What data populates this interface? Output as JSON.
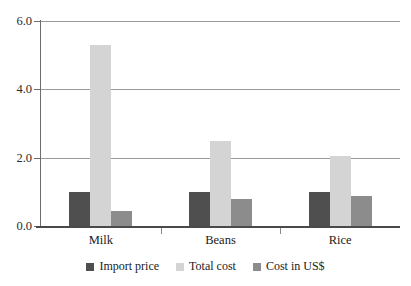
{
  "chart_data": {
    "type": "bar",
    "title": "",
    "subtitle": "",
    "xlabel": "",
    "ylabel": "",
    "categories": [
      "Milk",
      "Beans",
      "Rice"
    ],
    "series": [
      {
        "name": "Import price",
        "color": "#4f4f4f",
        "values": [
          1.0,
          1.0,
          1.0
        ]
      },
      {
        "name": "Total cost",
        "color": "#d4d4d4",
        "values": [
          5.3,
          2.5,
          2.05
        ]
      },
      {
        "name": "Cost in US$",
        "color": "#8c8c8c",
        "values": [
          0.44,
          0.78,
          0.87
        ]
      }
    ],
    "ylim": [
      0.0,
      6.0
    ],
    "ytick_values": [
      0.0,
      2.0,
      4.0,
      6.0
    ],
    "ytick_labels": [
      "0.0",
      "2.0",
      "4.0",
      "6.0"
    ],
    "grid": true,
    "gridlines_at": [
      2.0,
      4.0,
      6.0
    ],
    "legend_position": "bottom-center",
    "orientation": "vertical",
    "grouping": "clustered"
  },
  "axes": {
    "y_axis_color": "#6d6d6d",
    "x_axis_color": "#4a4a4a",
    "grid_color": "#9a9a9a"
  }
}
